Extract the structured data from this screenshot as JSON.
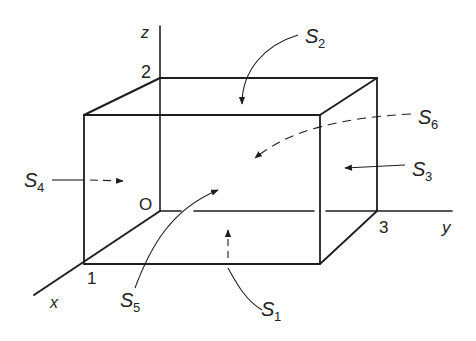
{
  "figure": {
    "axes": {
      "x": {
        "label": "x",
        "tick": "1"
      },
      "y": {
        "label": "y",
        "tick": "3"
      },
      "z": {
        "label": "z",
        "tick": "2"
      },
      "origin": "O"
    },
    "surfaces": [
      {
        "id": "S1",
        "base": "S",
        "sub": "1",
        "face": "bottom",
        "arrow": "dashed"
      },
      {
        "id": "S2",
        "base": "S",
        "sub": "2",
        "face": "top",
        "arrow": "solid"
      },
      {
        "id": "S3",
        "base": "S",
        "sub": "3",
        "face": "right",
        "arrow": "solid"
      },
      {
        "id": "S4",
        "base": "S",
        "sub": "4",
        "face": "left",
        "arrow": "dashed"
      },
      {
        "id": "S5",
        "base": "S",
        "sub": "5",
        "face": "front",
        "arrow": "solid"
      },
      {
        "id": "S6",
        "base": "S",
        "sub": "6",
        "face": "back",
        "arrow": "dashed"
      }
    ]
  },
  "colors": {
    "line": "#1e1e1e",
    "background": "#ffffff"
  }
}
